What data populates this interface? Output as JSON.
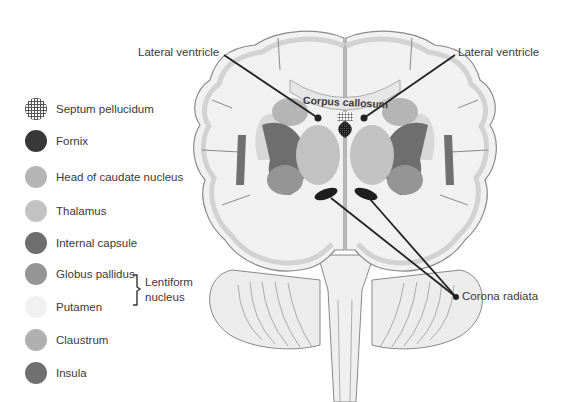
{
  "legend": {
    "items": [
      {
        "label": "Septum pellucidum",
        "swatch": "crosshatch",
        "color": "#8a8a8a"
      },
      {
        "label": "Fornix",
        "swatch": "dotted-dark",
        "color": "#222222"
      },
      {
        "label": "Head of caudate nucleus",
        "swatch": "solid",
        "color": "#b5b5b5"
      },
      {
        "label": "Thalamus",
        "swatch": "solid",
        "color": "#c2c2c2"
      },
      {
        "label": "Internal capsule",
        "swatch": "solid",
        "color": "#6e6e6e"
      },
      {
        "label": "Globus pallidus",
        "swatch": "solid",
        "color": "#959595"
      },
      {
        "label": "Putamen",
        "swatch": "solid",
        "color": "#f1f1f1"
      },
      {
        "label": "Claustrum",
        "swatch": "solid",
        "color": "#b0b0b0"
      },
      {
        "label": "Insula",
        "swatch": "solid",
        "color": "#707070"
      }
    ],
    "bracket_group": {
      "label_line1": "Lentiform",
      "label_line2": "nucleus",
      "members": [
        "Globus pallidus",
        "Putamen"
      ]
    }
  },
  "callouts": {
    "lateral_ventricle_left": "Lateral ventricle",
    "lateral_ventricle_right": "Lateral ventricle",
    "corpus_callosum": "Corpus callosum",
    "corona_radiata": "Corona radiata"
  }
}
